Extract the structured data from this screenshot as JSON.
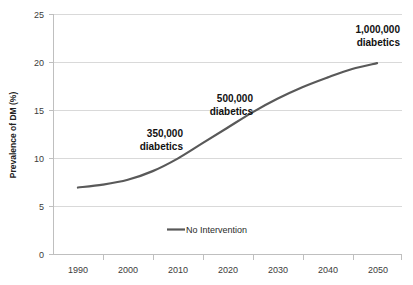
{
  "chart_data": {
    "type": "line",
    "title": "",
    "xlabel": "",
    "ylabel": "Prevalence of DM (%)",
    "xlim": [
      1985,
      2055
    ],
    "ylim": [
      0,
      25
    ],
    "grid": true,
    "legend_position": "bottom-center",
    "x_ticks": [
      "1990",
      "2000",
      "2010",
      "2020",
      "2030",
      "2040",
      "2050"
    ],
    "y_ticks": [
      "0",
      "5",
      "10",
      "15",
      "20",
      "25"
    ],
    "series": [
      {
        "name": "No Intervention",
        "color": "#595959",
        "x": [
          1990,
          1995,
          2000,
          2005,
          2010,
          2015,
          2020,
          2025,
          2030,
          2035,
          2040,
          2045,
          2050
        ],
        "values": [
          7.0,
          7.3,
          7.8,
          8.7,
          10.0,
          11.6,
          13.2,
          14.8,
          16.2,
          17.4,
          18.4,
          19.3,
          19.9
        ]
      }
    ],
    "annotations": [
      {
        "line1": "350,000",
        "line2": "diabetics",
        "x": 2010,
        "y": 12.8
      },
      {
        "line1": "500,000",
        "line2": "diabetics",
        "x": 2021,
        "y": 17.0
      },
      {
        "line1": "1,000,000",
        "line2": "diabetics",
        "x": 2044,
        "y": 23.2
      }
    ]
  },
  "axis": {
    "y_title": "Prevalence of DM (%)",
    "y_tick_0": "0",
    "y_tick_1": "5",
    "y_tick_2": "10",
    "y_tick_3": "15",
    "y_tick_4": "20",
    "y_tick_5": "25",
    "x_tick_0": "1990",
    "x_tick_1": "2000",
    "x_tick_2": "2010",
    "x_tick_3": "2020",
    "x_tick_4": "2030",
    "x_tick_5": "2040",
    "x_tick_6": "2050"
  },
  "legend": {
    "series_label": "No Intervention"
  },
  "annotations": {
    "a1_line1": "350,000",
    "a1_line2": "diabetics",
    "a2_line1": "500,000",
    "a2_line2": "diabetics",
    "a3_line1": "1,000,000",
    "a3_line2": "diabetics"
  },
  "colors": {
    "series": "#595959",
    "gridline": "#d9d9d9",
    "axis": "#bfbfbf",
    "text": "#3b3b3b",
    "background": "#ffffff"
  }
}
